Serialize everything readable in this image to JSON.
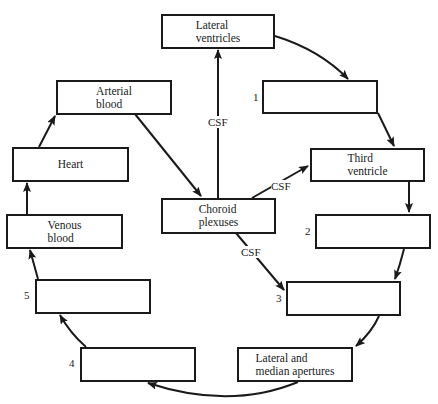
{
  "diagram": {
    "boxes": {
      "lateral_ventricles": "Lateral\nventricles",
      "blank_1": "",
      "third_ventricle": "Third\nventricle",
      "blank_2": "",
      "blank_3": "",
      "lateral_median_apertures": "Lateral and\nmedian apertures",
      "blank_4": "",
      "blank_5": "",
      "venous_blood": "Venous\nblood",
      "heart": "Heart",
      "arterial_blood": "Arterial\nblood",
      "choroid_plexuses": "Choroid\nplexuses"
    },
    "numbers": {
      "n1": "1",
      "n2": "2",
      "n3": "3",
      "n4": "4",
      "n5": "5"
    },
    "edge_labels": {
      "csf_up": "CSF",
      "csf_right": "CSF",
      "csf_down": "CSF"
    },
    "colors": {
      "line": "#1a1a1a",
      "background": "#ffffff"
    }
  }
}
